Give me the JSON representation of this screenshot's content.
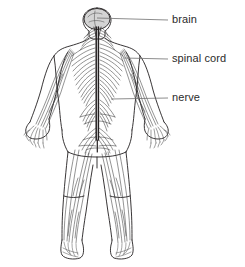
{
  "diagram": {
    "background_color": "#ffffff",
    "stroke_color": "#231f20",
    "brain_fill_color": "#d4d4d4",
    "label_text_color": "#2b2b2b",
    "leader_line_color": "#6e6e6e",
    "labels": [
      {
        "id": "brain",
        "text": "brain",
        "leader_from": {
          "x": 97,
          "y": 18
        },
        "leader_to": {
          "x": 168,
          "y": 20
        }
      },
      {
        "id": "spinal_cord",
        "text": "spinal cord",
        "leader_from": {
          "x": 124,
          "y": 58
        },
        "leader_to": {
          "x": 168,
          "y": 59
        }
      },
      {
        "id": "nerve",
        "text": "nerve",
        "leader_from": {
          "x": 111,
          "y": 99
        },
        "leader_to": {
          "x": 168,
          "y": 98
        }
      }
    ],
    "figure": {
      "view": "anterior full body",
      "parts": [
        "head",
        "brain",
        "neck",
        "torso",
        "spinal cord",
        "thoracic nerves",
        "left arm",
        "right arm",
        "left hand",
        "right hand",
        "pelvic nerve plexus",
        "left leg",
        "right leg",
        "left foot",
        "right foot"
      ]
    }
  }
}
